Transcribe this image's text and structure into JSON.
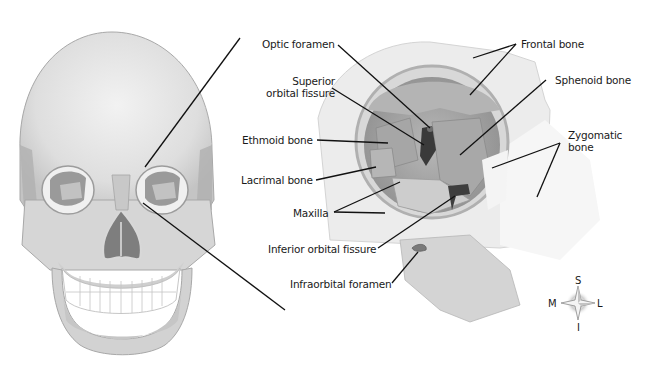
{
  "figure": {
    "left_panel": "Anterior view of skull",
    "right_panel": "Enlarged view of right orbit"
  },
  "labels": {
    "optic_foramen": "Optic foramen",
    "superior_orbital_fissure_line1": "Superior",
    "superior_orbital_fissure_line2": "orbital fissure",
    "ethmoid_bone": "Ethmoid bone",
    "lacrimal_bone": "Lacrimal bone",
    "maxilla": "Maxilla",
    "inferior_orbital_fissure": "Inferior orbital fissure",
    "infraorbital_foramen": "Infraorbital foramen",
    "frontal_bone": "Frontal bone",
    "sphenoid_bone": "Sphenoid bone",
    "zygomatic_bone_line1": "Zygomatic",
    "zygomatic_bone_line2": "bone"
  },
  "compass": {
    "superior": "S",
    "inferior": "I",
    "medial": "M",
    "lateral": "L"
  },
  "colors": {
    "bone_light": "#e4e4e4",
    "bone_mid": "#c8c8c8",
    "bone_dark": "#9a9a9a",
    "cavity": "#7a7a7a",
    "line": "#111111",
    "text": "#1a1a1a"
  }
}
